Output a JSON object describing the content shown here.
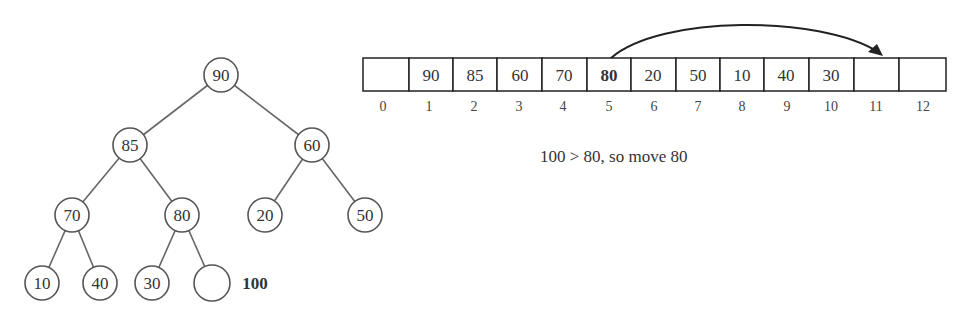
{
  "tree": {
    "nodes": [
      {
        "id": "n1",
        "value": "90",
        "x": 221,
        "y": 75
      },
      {
        "id": "n2",
        "value": "85",
        "x": 130,
        "y": 145
      },
      {
        "id": "n3",
        "value": "60",
        "x": 312,
        "y": 145
      },
      {
        "id": "n4",
        "value": "70",
        "x": 72,
        "y": 215
      },
      {
        "id": "n5",
        "value": "80",
        "x": 182,
        "y": 215
      },
      {
        "id": "n6",
        "value": "20",
        "x": 265,
        "y": 215
      },
      {
        "id": "n7",
        "value": "50",
        "x": 365,
        "y": 215
      },
      {
        "id": "n8",
        "value": "10",
        "x": 42,
        "y": 283
      },
      {
        "id": "n9",
        "value": "40",
        "x": 100,
        "y": 283
      },
      {
        "id": "n10",
        "value": "30",
        "x": 152,
        "y": 283
      },
      {
        "id": "n11",
        "value": "",
        "x": 212,
        "y": 283
      }
    ],
    "new_value_label": "100"
  },
  "array": {
    "cells": [
      "",
      "90",
      "85",
      "60",
      "70",
      "80",
      "20",
      "50",
      "10",
      "40",
      "30",
      "",
      ""
    ],
    "indices": [
      "0",
      "1",
      "2",
      "3",
      "4",
      "5",
      "6",
      "7",
      "8",
      "9",
      "10",
      "11",
      "12"
    ],
    "highlighted_index": 5,
    "arrow": {
      "from_index": 5,
      "to_index": 11
    }
  },
  "caption": "100 > 80, so move 80"
}
